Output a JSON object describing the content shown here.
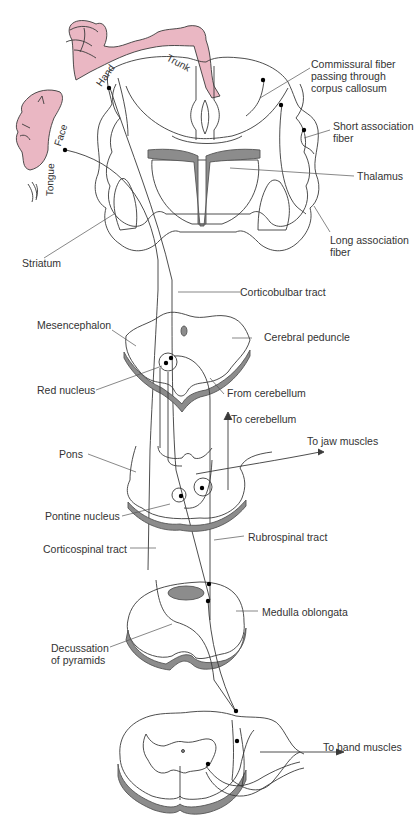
{
  "figure": {
    "colors": {
      "homunculus": "#eab7c3",
      "gray_matter": "#8c8c8c",
      "outline": "#3a3a3a",
      "background": "#ffffff"
    },
    "homunculus_labels": {
      "trunk": "Trunk",
      "hand": "Hand",
      "face": "Face",
      "tongue": "Tongue"
    },
    "labels": {
      "commissural": "Commissural fiber\npassing through\ncorpus callosum",
      "short_assoc": "Short association\nfiber",
      "thalamus": "Thalamus",
      "long_assoc": "Long association\nfiber",
      "striatum": "Striatum",
      "corticobulbar": "Corticobulbar tract",
      "mesencephalon": "Mesencephalon",
      "cerebral_peduncle": "Cerebral peduncle",
      "red_nucleus": "Red nucleus",
      "from_cerebellum": "From cerebellum",
      "to_cerebellum": "To cerebellum",
      "to_jaw": "To jaw muscles",
      "pons": "Pons",
      "pontine_nucleus": "Pontine nucleus",
      "corticospinal": "Corticospinal tract",
      "rubrospinal": "Rubrospinal tract",
      "medulla": "Medulla oblongata",
      "decussation": "Decussation\nof pyramids",
      "to_hand": "To hand muscles"
    }
  }
}
